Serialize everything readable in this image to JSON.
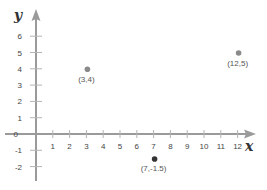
{
  "chart_data": {
    "type": "scatter",
    "title": "",
    "xlabel": "x",
    "ylabel": "y",
    "xlim": [
      0,
      12
    ],
    "ylim": [
      -2,
      6
    ],
    "x_ticks": [
      1,
      2,
      3,
      4,
      5,
      6,
      7,
      8,
      9,
      10,
      11,
      12
    ],
    "y_ticks": [
      -2,
      -1,
      0,
      1,
      2,
      3,
      4,
      5,
      6
    ],
    "origin_label": "0",
    "grid": false,
    "legend": null,
    "series": [
      {
        "name": "points",
        "points": [
          {
            "x": 3,
            "y": 4,
            "label": "(3,4)",
            "color": "#8a8a8a"
          },
          {
            "x": 12,
            "y": 5,
            "label": "(12,5)",
            "color": "#8a8a8a"
          },
          {
            "x": 7,
            "y": -1.5,
            "label": "(7,-1.5)",
            "color": "#333333"
          }
        ]
      }
    ],
    "axis_color": "#9a9a9a"
  }
}
